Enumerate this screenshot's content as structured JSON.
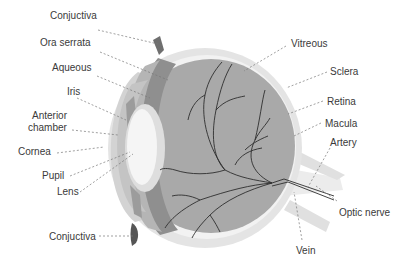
{
  "diagram": {
    "colors": {
      "background": "#ffffff",
      "sclera": "#e4e4e4",
      "sclera_inner": "#f2f2f2",
      "vitreous": "#a9a9a9",
      "ciliary_band": "#8f8f8f",
      "aqueous_band": "#b5b5b5",
      "iris": "#9c9c9c",
      "cornea": "#cfcfcf",
      "anterior_chamber": "#c2c2c2",
      "lens": "#f5f5f5",
      "lens_halo": "#dedede",
      "conjuctiva": "#6f6f6f",
      "vessel": "#2e2e2e",
      "leader_line": "#777777",
      "text": "#3a3a3a"
    },
    "labels": [
      {
        "id": "conjuctiva-top",
        "text": "Conjuctiva",
        "x": 50,
        "y": 15,
        "align": "left"
      },
      {
        "id": "ora-serrata",
        "text": "Ora serrata",
        "x": 40,
        "y": 42,
        "align": "left"
      },
      {
        "id": "aqueous",
        "text": "Aqueous",
        "x": 52,
        "y": 67,
        "align": "left"
      },
      {
        "id": "iris",
        "text": "Iris",
        "x": 67,
        "y": 91,
        "align": "left"
      },
      {
        "id": "anterior-chamber-1",
        "text": "Anterior",
        "x": 32,
        "y": 114,
        "align": "left"
      },
      {
        "id": "anterior-chamber-2",
        "text": "chamber",
        "x": 28,
        "y": 126,
        "align": "left"
      },
      {
        "id": "cornea",
        "text": "Cornea",
        "x": 18,
        "y": 148,
        "align": "left"
      },
      {
        "id": "pupil",
        "text": "Pupil",
        "x": 42,
        "y": 171,
        "align": "left"
      },
      {
        "id": "lens",
        "text": "Lens",
        "x": 57,
        "y": 187,
        "align": "left"
      },
      {
        "id": "conjuctiva-bottom",
        "text": "Conjuctiva",
        "x": 49,
        "y": 232,
        "align": "left"
      },
      {
        "id": "vitreous",
        "text": "Vitreous",
        "x": 291,
        "y": 38,
        "align": "left"
      },
      {
        "id": "sclera",
        "text": "Sclera",
        "x": 330,
        "y": 66,
        "align": "left"
      },
      {
        "id": "retina",
        "text": "Retina",
        "x": 327,
        "y": 95,
        "align": "left"
      },
      {
        "id": "macula",
        "text": "Macula",
        "x": 325,
        "y": 117,
        "align": "left"
      },
      {
        "id": "artery",
        "text": "Artery",
        "x": 330,
        "y": 136,
        "align": "left"
      },
      {
        "id": "optic-nerve",
        "text": "Optic nerve",
        "x": 339,
        "y": 207,
        "align": "left"
      },
      {
        "id": "vein",
        "text": "Vein",
        "x": 296,
        "y": 244,
        "align": "left"
      }
    ]
  }
}
